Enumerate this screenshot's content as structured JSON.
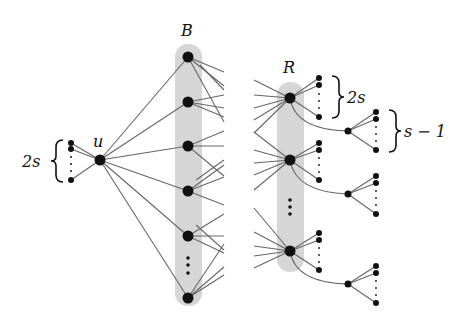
{
  "diagram": {
    "labels": {
      "B": "B",
      "R": "R",
      "u": "u",
      "left_brace": "2s",
      "r_brace": "2s",
      "sub_brace": "s − 1"
    },
    "colors": {
      "node": "#111111",
      "edge": "#666666",
      "shade": "#d6d6d6"
    },
    "nodes": {
      "u": {
        "x": 100,
        "y": 160
      },
      "u_leaves": [
        {
          "x": 71,
          "y": 143
        },
        {
          "x": 71,
          "y": 149
        },
        {
          "x": 71,
          "y": 180
        }
      ],
      "B": [
        {
          "x": 188,
          "y": 57
        },
        {
          "x": 188,
          "y": 102
        },
        {
          "x": 188,
          "y": 146
        },
        {
          "x": 188,
          "y": 191
        },
        {
          "x": 188,
          "y": 236
        },
        {
          "x": 188,
          "y": 298
        }
      ],
      "R": [
        {
          "x": 290,
          "y": 98
        },
        {
          "x": 290,
          "y": 160
        },
        {
          "x": 290,
          "y": 251
        }
      ]
    }
  }
}
